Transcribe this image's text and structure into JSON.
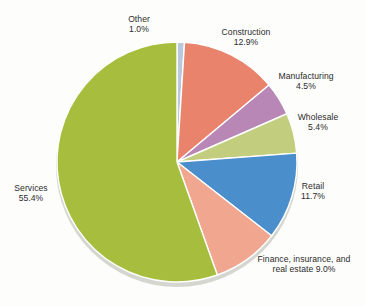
{
  "chart_data": {
    "type": "pie",
    "title": "",
    "subtitle": "",
    "xlabel": "",
    "ylabel": "",
    "legend_position": "none",
    "grid": false,
    "units": "percent",
    "start_angle_deg": 0,
    "direction": "clockwise",
    "categories": [
      "Other",
      "Construction",
      "Manufacturing",
      "Wholesale",
      "Retail",
      "Finance, insurance, and real estate",
      "Services"
    ],
    "values": [
      1.0,
      12.9,
      4.5,
      5.4,
      11.7,
      9.0,
      55.4
    ],
    "total": 99.9,
    "slices": [
      {
        "name": "Other",
        "value": 1.0,
        "value_text": "1.0%",
        "color": "#b9c8dd"
      },
      {
        "name": "Construction",
        "value": 12.9,
        "value_text": "12.9%",
        "color": "#e9836b"
      },
      {
        "name": "Manufacturing",
        "value": 4.5,
        "value_text": "4.5%",
        "color": "#b887b5"
      },
      {
        "name": "Wholesale",
        "value": 5.4,
        "value_text": "5.4%",
        "color": "#c2ce7e"
      },
      {
        "name": "Retail",
        "value": 11.7,
        "value_text": "11.7%",
        "color": "#4a8ecb"
      },
      {
        "name": "Finance, insurance, and real estate",
        "value": 9.0,
        "value_text": "9.0%",
        "color": "#f1a78f"
      },
      {
        "name": "Services",
        "value": 55.4,
        "value_text": "55.4%",
        "color": "#a6bd3e"
      }
    ]
  },
  "labels": {
    "other": {
      "line1": "Other",
      "line2": "1.0%"
    },
    "construction": {
      "line1": "Construction",
      "line2": "12.9%"
    },
    "manufacturing": {
      "line1": "Manufacturing",
      "line2": "4.5%"
    },
    "wholesale": {
      "line1": "Wholesale",
      "line2": "5.4%"
    },
    "retail": {
      "line1": "Retail",
      "line2": "11.7%"
    },
    "finance": {
      "line1": "Finance, insurance, and",
      "line2": "real estate 9.0%"
    },
    "services": {
      "line1": "Services",
      "line2": "55.4%"
    }
  },
  "style": {
    "background": "#fdfdfb",
    "slice_stroke": "#ffffff",
    "shadow_color": "#b5b5ad",
    "text_color": "#2b2b2b"
  }
}
